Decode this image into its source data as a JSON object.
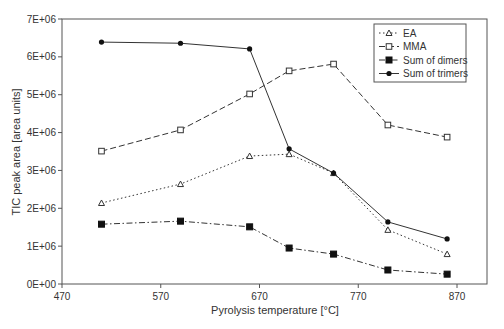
{
  "chart_data": {
    "type": "line",
    "title": "",
    "xlabel": "Pyrolysis temperature [°C]",
    "ylabel": "TIC peak area [area units]",
    "xlim": [
      470,
      900
    ],
    "ylim": [
      0,
      7000000
    ],
    "xticks": [
      470,
      570,
      670,
      770,
      870
    ],
    "yticks": [
      0,
      1000000,
      2000000,
      3000000,
      4000000,
      5000000,
      6000000,
      7000000
    ],
    "ytick_labels": [
      "0E+00",
      "1E+06",
      "2E+06",
      "3E+06",
      "4E+06",
      "5E+06",
      "6E+06",
      "7E+06"
    ],
    "grid": false,
    "legend_position": "upper right",
    "x": [
      510,
      590,
      660,
      700,
      745,
      800,
      860
    ],
    "series": [
      {
        "name": "EA",
        "marker": "triangle-open",
        "line": "dotted",
        "values": [
          2140000,
          2640000,
          3380000,
          3430000,
          2930000,
          1430000,
          790000
        ]
      },
      {
        "name": "MMA",
        "marker": "square-open",
        "line": "dashed",
        "values": [
          3510000,
          4070000,
          5020000,
          5630000,
          5810000,
          4200000,
          3880000
        ]
      },
      {
        "name": "Sum of dimers",
        "marker": "square-filled",
        "line": "dashdot",
        "values": [
          1580000,
          1660000,
          1510000,
          950000,
          790000,
          370000,
          260000
        ]
      },
      {
        "name": "Sum of trimers",
        "marker": "circle-filled",
        "line": "solid",
        "values": [
          6390000,
          6360000,
          6210000,
          3570000,
          2930000,
          1640000,
          1190000
        ]
      }
    ]
  }
}
